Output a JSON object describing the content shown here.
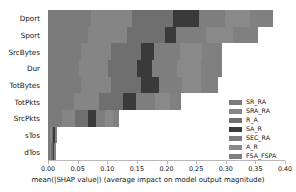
{
  "chart_data": {
    "type": "bar",
    "orientation": "horizontal",
    "stacked": true,
    "title": "",
    "xlabel": "mean(|SHAP value|) (average impact on model output magnitude)",
    "ylabel": "",
    "xlim": [
      0.0,
      0.4
    ],
    "xticks": [
      "0.00",
      "0.05",
      "0.10",
      "0.15",
      "0.20",
      "0.25",
      "0.30",
      "0.35",
      "0.40"
    ],
    "xtick_values": [
      0.0,
      0.05,
      0.1,
      0.15,
      0.2,
      0.25,
      0.3,
      0.35,
      0.4
    ],
    "grid": false,
    "legend_position": "right",
    "categories": [
      "Dport",
      "Sport",
      "SrcBytes",
      "Dur",
      "TotBytes",
      "TotPkts",
      "SrcPkts",
      "sTos",
      "dTos"
    ],
    "totals": [
      0.38,
      0.354,
      0.294,
      0.294,
      0.287,
      0.225,
      0.12,
      0.015,
      0.013
    ],
    "series": [
      {
        "name": "SR_RA",
        "color": "#7b7b7b",
        "values": [
          0.072,
          0.068,
          0.055,
          0.052,
          0.055,
          0.044,
          0.024,
          0.0035,
          0.003
        ]
      },
      {
        "name": "SRA_RA",
        "color": "#858585",
        "values": [
          0.07,
          0.066,
          0.052,
          0.05,
          0.052,
          0.042,
          0.022,
          0.003,
          0.0026
        ]
      },
      {
        "name": "R_A",
        "color": "#6f6f6f",
        "values": [
          0.069,
          0.064,
          0.05,
          0.048,
          0.05,
          0.04,
          0.021,
          0.0028,
          0.0024
        ]
      },
      {
        "name": "SA_R",
        "color": "#3a3a3a",
        "values": [
          0.044,
          0.018,
          0.022,
          0.026,
          0.031,
          0.023,
          0.014,
          0.002,
          0.0017
        ]
      },
      {
        "name": "SEC_RA",
        "color": "#7e7e7e",
        "values": [
          0.044,
          0.05,
          0.043,
          0.042,
          0.039,
          0.031,
          0.015,
          0.0016,
          0.0013
        ]
      },
      {
        "name": "A_R",
        "color": "#898989",
        "values": [
          0.042,
          0.047,
          0.038,
          0.04,
          0.032,
          0.026,
          0.013,
          0.0013,
          0.0011
        ]
      },
      {
        "name": "FSA_FSPA",
        "color": "#808080",
        "values": [
          0.039,
          0.041,
          0.034,
          0.036,
          0.028,
          0.019,
          0.011,
          0.0008,
          0.0009
        ]
      }
    ]
  },
  "axes": {
    "x_title": "mean(|SHAP value|) (average impact on model output magnitude)"
  },
  "legend": {
    "items": [
      {
        "label": "SR_RA"
      },
      {
        "label": "SRA_RA"
      },
      {
        "label": "R_A"
      },
      {
        "label": "SA_R"
      },
      {
        "label": "SEC_RA"
      },
      {
        "label": "A_R"
      },
      {
        "label": "FSA_FSPA"
      }
    ]
  },
  "colors": {
    "axis": "#b8b8b8",
    "text": "#111111",
    "background": "#ffffff"
  }
}
